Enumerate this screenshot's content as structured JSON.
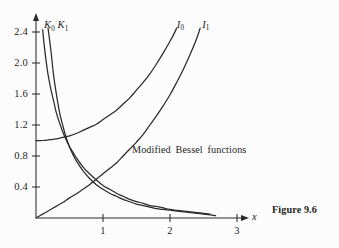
{
  "figure": {
    "caption": "Figure 9.6",
    "annotation": "Modified  Bessel  functions",
    "background_color": "#fcfcfc",
    "ink_color": "#2b2b2b"
  },
  "chart_data": {
    "type": "line",
    "title": "Modified Bessel functions",
    "xlabel": "x",
    "ylabel": "",
    "xlim": [
      0,
      3.2
    ],
    "ylim": [
      0,
      2.55
    ],
    "grid": false,
    "legend": "inline-curve-labels",
    "xticks": [
      1,
      2,
      3
    ],
    "xtick_labels": [
      "1",
      "2",
      "3"
    ],
    "yticks": [
      0.4,
      0.8,
      1.2,
      1.6,
      2.0,
      2.4
    ],
    "ytick_labels": [
      "0.4",
      "0.8",
      "1.2",
      "1.6",
      "2.0",
      "2.4"
    ],
    "series": [
      {
        "name": "K_0",
        "label": "K",
        "label_sub": "0",
        "label_pos": [
          0.12,
          2.55
        ],
        "x": [
          0.1,
          0.12,
          0.15,
          0.18,
          0.22,
          0.26,
          0.3,
          0.35,
          0.4,
          0.45,
          0.5,
          0.55,
          0.6,
          0.7,
          0.8,
          0.9,
          1.0,
          1.1,
          1.2,
          1.3,
          1.4,
          1.5,
          1.6,
          1.7,
          1.8,
          1.9,
          2.0,
          2.1,
          2.2,
          2.3,
          2.4,
          2.5,
          2.6
        ],
        "y": [
          2.43,
          2.25,
          2.03,
          1.85,
          1.67,
          1.52,
          1.37,
          1.23,
          1.11,
          1.01,
          0.92,
          0.85,
          0.78,
          0.66,
          0.57,
          0.49,
          0.42,
          0.37,
          0.32,
          0.28,
          0.24,
          0.21,
          0.19,
          0.16,
          0.15,
          0.13,
          0.11,
          0.1,
          0.09,
          0.08,
          0.07,
          0.06,
          0.05
        ]
      },
      {
        "name": "K_1",
        "label": "K",
        "label_sub": "1",
        "label_pos": [
          0.32,
          2.55
        ],
        "x": [
          0.18,
          0.22,
          0.26,
          0.3,
          0.35,
          0.4,
          0.45,
          0.5,
          0.55,
          0.6,
          0.7,
          0.8,
          0.9,
          1.0,
          1.1,
          1.2,
          1.3,
          1.4,
          1.5,
          1.6,
          1.7,
          1.8,
          1.9,
          2.0,
          2.1,
          2.2,
          2.3,
          2.4,
          2.5,
          2.6,
          2.68
        ],
        "y": [
          2.45,
          2.18,
          1.86,
          1.62,
          1.37,
          1.19,
          1.04,
          0.92,
          0.82,
          0.74,
          0.61,
          0.51,
          0.43,
          0.37,
          0.32,
          0.28,
          0.24,
          0.21,
          0.18,
          0.16,
          0.14,
          0.12,
          0.11,
          0.1,
          0.09,
          0.08,
          0.07,
          0.06,
          0.05,
          0.04,
          0.03
        ]
      },
      {
        "name": "I_0",
        "label": "I",
        "label_sub": "0",
        "label_pos": [
          2.1,
          2.56
        ],
        "x": [
          0.0,
          0.1,
          0.2,
          0.3,
          0.4,
          0.5,
          0.6,
          0.7,
          0.8,
          0.9,
          1.0,
          1.1,
          1.2,
          1.3,
          1.4,
          1.5,
          1.6,
          1.7,
          1.8,
          1.9,
          2.0,
          2.05,
          2.1
        ],
        "y": [
          1.0,
          1.0,
          1.01,
          1.02,
          1.04,
          1.06,
          1.09,
          1.13,
          1.17,
          1.21,
          1.27,
          1.33,
          1.39,
          1.47,
          1.55,
          1.65,
          1.75,
          1.86,
          1.99,
          2.13,
          2.28,
          2.36,
          2.45
        ]
      },
      {
        "name": "I_1",
        "label": "I",
        "label_sub": "1",
        "label_pos": [
          2.48,
          2.56
        ],
        "x": [
          0.0,
          0.1,
          0.2,
          0.3,
          0.4,
          0.5,
          0.6,
          0.7,
          0.8,
          0.9,
          1.0,
          1.1,
          1.2,
          1.3,
          1.4,
          1.5,
          1.6,
          1.7,
          1.8,
          1.9,
          2.0,
          2.1,
          2.2,
          2.3,
          2.4,
          2.45
        ],
        "y": [
          0.0,
          0.05,
          0.1,
          0.15,
          0.2,
          0.26,
          0.31,
          0.37,
          0.43,
          0.5,
          0.57,
          0.64,
          0.71,
          0.8,
          0.89,
          0.98,
          1.08,
          1.2,
          1.32,
          1.45,
          1.59,
          1.75,
          1.92,
          2.11,
          2.32,
          2.45
        ]
      }
    ]
  }
}
